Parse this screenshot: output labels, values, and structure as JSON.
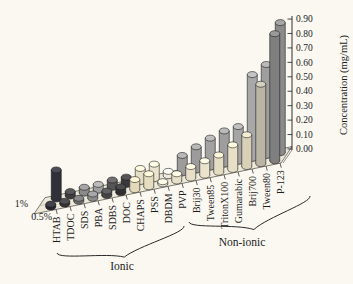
{
  "figure": {
    "background": "#faf8f1",
    "ink": "#1b1b1b"
  },
  "chart_data": {
    "type": "bar",
    "projection": "3d-cylinder-bars",
    "title": "",
    "ylabel": "Concentration (mg/mL)",
    "xlabel": "",
    "ylim": [
      0,
      0.9
    ],
    "ytick_labels": [
      "0.00",
      "0.10",
      "0.20",
      "0.30",
      "0.40",
      "0.50",
      "0.60",
      "0.70",
      "0.80",
      "0.90"
    ],
    "ytick_values": [
      0.0,
      0.1,
      0.2,
      0.3,
      0.4,
      0.5,
      0.6,
      0.7,
      0.8,
      0.9
    ],
    "grid": false,
    "legend_position": "depth-axis-left",
    "row_labels": {
      "back": "1%",
      "front": "0.5%"
    },
    "categories": [
      "HTAB",
      "TDOC",
      "SDS",
      "PBA",
      "SDBS",
      "DOC",
      "CHAPS",
      "PSS",
      "DBDM",
      "PVP",
      "Brij30",
      "Tween85",
      "TritonX100",
      "Gumarabic",
      "Brij700",
      "Tween80",
      "P-123"
    ],
    "series": [
      {
        "name": "1%",
        "row": "back",
        "values": [
          0.2,
          0.03,
          0.04,
          0.04,
          0.05,
          0.05,
          0.09,
          0.1,
          0.03,
          0.12,
          0.16,
          0.2,
          0.23,
          0.24,
          0.58,
          0.63,
          0.9
        ]
      },
      {
        "name": "0.5%",
        "row": "front",
        "values": [
          0.02,
          0.02,
          0.02,
          0.03,
          0.03,
          0.04,
          0.07,
          0.09,
          0.015,
          0.05,
          0.08,
          0.1,
          0.12,
          0.17,
          0.22,
          0.55,
          0.88
        ]
      }
    ],
    "bar_colors": [
      {
        "back": "#30303a",
        "front": "#272731"
      },
      {
        "back": "#3d3d3f",
        "front": "#343436"
      },
      {
        "back": "#8a8a8a",
        "front": "#6e6e6e"
      },
      {
        "back": "#a0a0a0",
        "front": "#8c8c8c"
      },
      {
        "back": "#555557",
        "front": "#464648"
      },
      {
        "back": "#39393b",
        "front": "#303032"
      },
      {
        "back": "#e7dfc4",
        "front": "#e2d9ba"
      },
      {
        "back": "#ece4ca",
        "front": "#e6ddc0"
      },
      {
        "back": "#efeadb",
        "front": "#e9e3d0"
      },
      {
        "back": "#9c9c9c",
        "front": "#e7dfc8"
      },
      {
        "back": "#9c9c9c",
        "front": "#e7dfc8"
      },
      {
        "back": "#a2a2a2",
        "front": "#eae2ca"
      },
      {
        "back": "#9e9e9e",
        "front": "#e5ddc2"
      },
      {
        "back": "#a5a5a5",
        "front": "#e8e0c6"
      },
      {
        "back": "#a8a8a8",
        "front": "#d8d1b8"
      },
      {
        "back": "#9e9e9e",
        "front": "#b9b4a4"
      },
      {
        "back": "#8b8b8b",
        "front": "#7f7f7f"
      }
    ],
    "groups": [
      {
        "label": "Ionic",
        "from": 0,
        "to": 7
      },
      {
        "label": "Non-ionic",
        "from": 8,
        "to": 16
      }
    ]
  }
}
